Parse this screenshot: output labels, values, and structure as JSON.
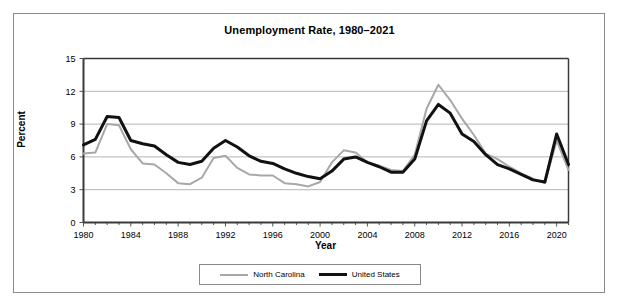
{
  "chart_data": {
    "type": "line",
    "title": "Unemployment Rate, 1980–2021",
    "xlabel": "Year",
    "ylabel": "Percent",
    "ylim": [
      0,
      15
    ],
    "xlim": [
      1980,
      2021
    ],
    "y_ticks": [
      0,
      3,
      6,
      9,
      12,
      15
    ],
    "x_ticks": [
      1980,
      1984,
      1988,
      1992,
      1996,
      2000,
      2004,
      2008,
      2012,
      2016,
      2020
    ],
    "grid": "horizontal",
    "legend_position": "bottom",
    "x": [
      1980,
      1981,
      1982,
      1983,
      1984,
      1985,
      1986,
      1987,
      1988,
      1989,
      1990,
      1991,
      1992,
      1993,
      1994,
      1995,
      1996,
      1997,
      1998,
      1999,
      2000,
      2001,
      2002,
      2003,
      2004,
      2005,
      2006,
      2007,
      2008,
      2009,
      2010,
      2011,
      2012,
      2013,
      2014,
      2015,
      2016,
      2017,
      2018,
      2019,
      2020,
      2021
    ],
    "series": [
      {
        "name": "North Carolina",
        "color": "#a8a8a8",
        "line_width": 2,
        "values": [
          6.3,
          6.4,
          9.0,
          8.9,
          6.7,
          5.4,
          5.3,
          4.5,
          3.6,
          3.5,
          4.1,
          5.9,
          6.1,
          5.0,
          4.4,
          4.3,
          4.3,
          3.6,
          3.5,
          3.3,
          3.7,
          5.5,
          6.6,
          6.4,
          5.5,
          5.2,
          4.8,
          4.7,
          6.2,
          10.4,
          12.6,
          11.2,
          9.5,
          8.0,
          6.3,
          5.8,
          5.1,
          4.5,
          4.0,
          3.6,
          7.5,
          4.8
        ]
      },
      {
        "name": "United States",
        "color": "#111111",
        "line_width": 3,
        "values": [
          7.1,
          7.6,
          9.7,
          9.6,
          7.5,
          7.2,
          7.0,
          6.2,
          5.5,
          5.3,
          5.6,
          6.8,
          7.5,
          6.9,
          6.1,
          5.6,
          5.4,
          4.9,
          4.5,
          4.2,
          4.0,
          4.7,
          5.8,
          6.0,
          5.5,
          5.1,
          4.6,
          4.6,
          5.8,
          9.3,
          10.8,
          10.0,
          8.1,
          7.4,
          6.2,
          5.3,
          4.9,
          4.4,
          3.9,
          3.7,
          8.1,
          5.3
        ]
      }
    ]
  },
  "chart": {
    "title": "Unemployment Rate, 1980–2021",
    "x_axis_title": "Year",
    "y_axis_title": "Percent"
  },
  "legend": {
    "items": [
      {
        "label": "North Carolina"
      },
      {
        "label": "United States"
      }
    ]
  }
}
